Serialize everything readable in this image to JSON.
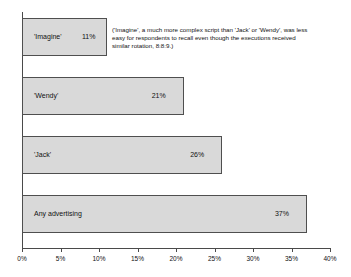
{
  "chart_data": {
    "type": "bar",
    "orientation": "horizontal",
    "title": "",
    "subtitle": "",
    "xlabel": "",
    "ylabel": "",
    "categories": [
      "'Imagine'",
      "'Wendy'",
      "'Jack'",
      "Any advertising"
    ],
    "values": [
      11,
      21,
      26,
      37
    ],
    "value_labels": [
      "11%",
      "21%",
      "26%",
      "37%"
    ],
    "xlim": [
      0,
      40
    ],
    "xticks": [
      0,
      5,
      10,
      15,
      20,
      25,
      30,
      35,
      40
    ],
    "xtick_labels": [
      "0%",
      "5%",
      "10%",
      "15%",
      "20%",
      "25%",
      "30%",
      "35%",
      "40%"
    ],
    "grid": false,
    "legend": "none",
    "bar_color": "#d9d9d9",
    "bar_border_color": "#4f4f4f",
    "axis_color": "#4a4a4a",
    "annotations": [
      "('Imagine', a much more complex script than 'Jack' or 'Wendy', was less",
      "easy for respondents to recall even though the executions received",
      "similar rotation, 8:8:9.)"
    ]
  }
}
